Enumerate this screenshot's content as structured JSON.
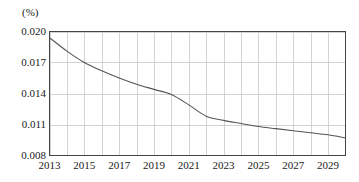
{
  "chart_data": {
    "type": "line",
    "title": "",
    "subtitle": "",
    "xlabel": "",
    "ylabel": "",
    "unit_label": "(%)",
    "grid": true,
    "legend": false,
    "xlim": [
      2013,
      2030
    ],
    "ylim": [
      0.008,
      0.02
    ],
    "y_ticks": [
      0.02,
      0.017,
      0.014,
      0.011,
      0.008
    ],
    "y_tick_labels": [
      "0.020",
      "0.017",
      "0.014",
      "0.011",
      "0.008"
    ],
    "x_ticks": [
      2013,
      2015,
      2017,
      2019,
      2021,
      2023,
      2025,
      2027,
      2029
    ],
    "x_tick_labels": [
      "2013",
      "2015",
      "2017",
      "2019",
      "2021",
      "2023",
      "2025",
      "2027",
      "2029"
    ],
    "x_gridline_years": [
      2013,
      2014,
      2015,
      2016,
      2017,
      2018,
      2019,
      2020,
      2021,
      2022,
      2023,
      2024,
      2025,
      2026,
      2027,
      2028,
      2029,
      2030
    ],
    "x": [
      2013,
      2014,
      2015,
      2016,
      2017,
      2018,
      2019,
      2020,
      2021,
      2022,
      2023,
      2024,
      2025,
      2026,
      2027,
      2028,
      2029,
      2030
    ],
    "values": [
      0.0194,
      0.0181,
      0.017,
      0.0162,
      0.0155,
      0.0149,
      0.0144,
      0.0139,
      0.0129,
      0.0118,
      0.0114,
      0.0111,
      0.0108,
      0.0106,
      0.0104,
      0.0102,
      0.01,
      0.0097
    ],
    "series": [
      {
        "name": "rate",
        "values": [
          0.0194,
          0.0181,
          0.017,
          0.0162,
          0.0155,
          0.0149,
          0.0144,
          0.0139,
          0.0129,
          0.0118,
          0.0114,
          0.0111,
          0.0108,
          0.0106,
          0.0104,
          0.0102,
          0.01,
          0.0097
        ]
      }
    ],
    "colors": {
      "line": "#555555",
      "grid": "#c8c8c8",
      "border": "#444444",
      "background": "#ffffff",
      "text": "#1a1a1a"
    }
  }
}
